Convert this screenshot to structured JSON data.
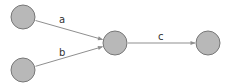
{
  "diagram": {
    "type": "directed-graph",
    "colors": {
      "node_fill": "#b8b8b8",
      "node_stroke": "#777777",
      "edge": "#8f8f8f",
      "label": "#333333",
      "background": "#ffffff"
    },
    "nodes": [
      {
        "id": "n1",
        "cx": 23,
        "cy": 17,
        "r": 12
      },
      {
        "id": "n2",
        "cx": 23,
        "cy": 70,
        "r": 12
      },
      {
        "id": "n3",
        "cx": 115,
        "cy": 43,
        "r": 12
      },
      {
        "id": "n4",
        "cx": 208,
        "cy": 43,
        "r": 12
      }
    ],
    "edges": [
      {
        "from": "n1",
        "to": "n3",
        "label": "a",
        "label_x": 59,
        "label_y": 23
      },
      {
        "from": "n2",
        "to": "n3",
        "label": "b",
        "label_x": 59,
        "label_y": 56
      },
      {
        "from": "n3",
        "to": "n4",
        "label": "c",
        "label_x": 158,
        "label_y": 40
      }
    ]
  }
}
